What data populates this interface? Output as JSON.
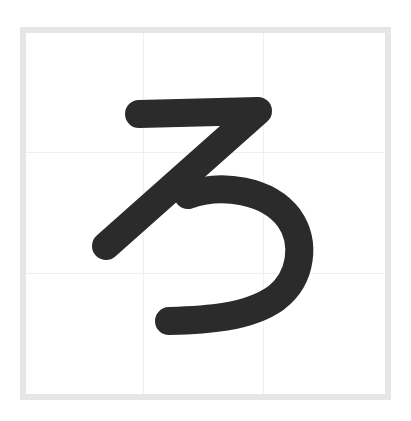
{
  "character": {
    "glyph": "ろ",
    "stroke_color": "#2b2b2b",
    "stroke_width": 28
  },
  "frame": {
    "border_color": "#e6e6e6",
    "grid_color": "#efefef",
    "background": "#ffffff",
    "grid_columns": 3,
    "grid_rows": 3
  }
}
